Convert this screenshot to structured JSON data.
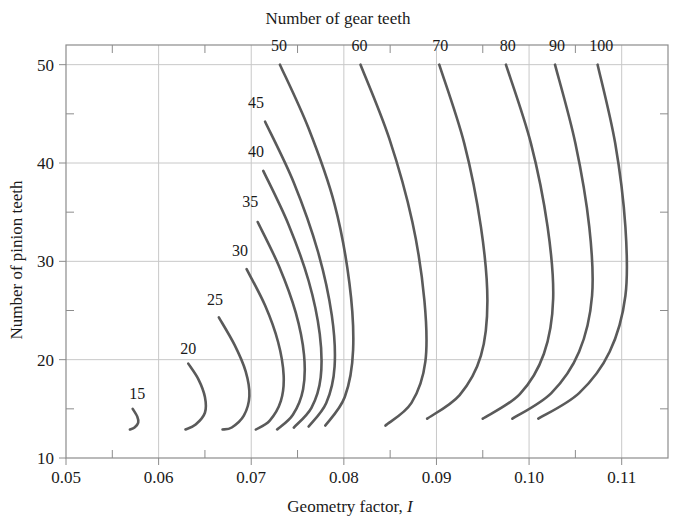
{
  "chart_data": {
    "type": "line",
    "title": "Number of gear teeth",
    "xlabel": "Geometry factor, I",
    "ylabel": "Number of pinion teeth",
    "xlim": [
      0.05,
      0.115
    ],
    "ylim": [
      10,
      52
    ],
    "xticks": [
      "0.05",
      "0.06",
      "0.07",
      "0.08",
      "0.09",
      "0.10",
      "0.11"
    ],
    "xtick_values": [
      0.05,
      0.06,
      0.07,
      0.08,
      0.09,
      0.1,
      0.11
    ],
    "yticks": [
      "10",
      "20",
      "30",
      "40",
      "50"
    ],
    "ytick_values": [
      10,
      20,
      30,
      40,
      50
    ],
    "yminor_values": [
      15,
      25,
      35,
      45
    ],
    "xminor_values": [
      0.055,
      0.065,
      0.075,
      0.085,
      0.095,
      0.105
    ],
    "grid": true,
    "legend_position": "inline-curve-labels",
    "line_color": "#5a5a5a",
    "grid_color": "#c8c8c8",
    "axis_color": "#8c8c8c",
    "series": [
      {
        "name": "15",
        "label": "15",
        "label_pos": {
          "x": 0.0577,
          "y": 16.0
        },
        "points": [
          {
            "x": 0.0572,
            "y": 15.0
          },
          {
            "x": 0.0577,
            "y": 14.2
          },
          {
            "x": 0.0578,
            "y": 13.6
          },
          {
            "x": 0.0574,
            "y": 13.1
          },
          {
            "x": 0.0569,
            "y": 12.9
          }
        ]
      },
      {
        "name": "20",
        "label": "20",
        "label_pos": {
          "x": 0.0632,
          "y": 20.6
        },
        "points": [
          {
            "x": 0.0632,
            "y": 19.6
          },
          {
            "x": 0.0643,
            "y": 18.0
          },
          {
            "x": 0.065,
            "y": 16.2
          },
          {
            "x": 0.065,
            "y": 14.6
          },
          {
            "x": 0.064,
            "y": 13.4
          },
          {
            "x": 0.0629,
            "y": 12.9
          }
        ]
      },
      {
        "name": "25",
        "label": "25",
        "label_pos": {
          "x": 0.0661,
          "y": 25.6
        },
        "points": [
          {
            "x": 0.0665,
            "y": 24.3
          },
          {
            "x": 0.0682,
            "y": 21.5
          },
          {
            "x": 0.0694,
            "y": 18.8
          },
          {
            "x": 0.0698,
            "y": 16.3
          },
          {
            "x": 0.0692,
            "y": 14.3
          },
          {
            "x": 0.0679,
            "y": 13.1
          },
          {
            "x": 0.0669,
            "y": 12.9
          }
        ]
      },
      {
        "name": "30",
        "label": "30",
        "label_pos": {
          "x": 0.0688,
          "y": 30.5
        },
        "points": [
          {
            "x": 0.0695,
            "y": 29.2
          },
          {
            "x": 0.0715,
            "y": 25.5
          },
          {
            "x": 0.0729,
            "y": 21.8
          },
          {
            "x": 0.0735,
            "y": 18.4
          },
          {
            "x": 0.0732,
            "y": 15.8
          },
          {
            "x": 0.072,
            "y": 13.8
          },
          {
            "x": 0.0705,
            "y": 12.9
          }
        ]
      },
      {
        "name": "35",
        "label": "35",
        "label_pos": {
          "x": 0.0699,
          "y": 35.5
        },
        "points": [
          {
            "x": 0.0707,
            "y": 34.0
          },
          {
            "x": 0.073,
            "y": 29.5
          },
          {
            "x": 0.0748,
            "y": 24.8
          },
          {
            "x": 0.0757,
            "y": 20.5
          },
          {
            "x": 0.0756,
            "y": 17.0
          },
          {
            "x": 0.0745,
            "y": 14.4
          },
          {
            "x": 0.0728,
            "y": 12.9
          }
        ]
      },
      {
        "name": "40",
        "label": "40",
        "label_pos": {
          "x": 0.0705,
          "y": 40.6
        },
        "points": [
          {
            "x": 0.0713,
            "y": 39.2
          },
          {
            "x": 0.074,
            "y": 33.8
          },
          {
            "x": 0.0762,
            "y": 28.0
          },
          {
            "x": 0.0774,
            "y": 22.6
          },
          {
            "x": 0.0775,
            "y": 18.2
          },
          {
            "x": 0.0765,
            "y": 15.1
          },
          {
            "x": 0.0746,
            "y": 13.1
          }
        ]
      },
      {
        "name": "45",
        "label": "45",
        "label_pos": {
          "x": 0.0705,
          "y": 45.6
        },
        "points": [
          {
            "x": 0.0715,
            "y": 44.2
          },
          {
            "x": 0.0746,
            "y": 38.0
          },
          {
            "x": 0.0772,
            "y": 31.0
          },
          {
            "x": 0.0787,
            "y": 24.5
          },
          {
            "x": 0.079,
            "y": 19.3
          },
          {
            "x": 0.0781,
            "y": 15.6
          },
          {
            "x": 0.0762,
            "y": 13.2
          }
        ]
      },
      {
        "name": "50",
        "label": "50",
        "label_pos": {
          "x": 0.073,
          "y": 51.4
        },
        "points": [
          {
            "x": 0.0731,
            "y": 50.0
          },
          {
            "x": 0.0762,
            "y": 43.5
          },
          {
            "x": 0.079,
            "y": 35.8
          },
          {
            "x": 0.0806,
            "y": 27.8
          },
          {
            "x": 0.081,
            "y": 21.0
          },
          {
            "x": 0.0801,
            "y": 16.2
          },
          {
            "x": 0.078,
            "y": 13.3
          }
        ]
      },
      {
        "name": "60",
        "label": "60",
        "label_pos": {
          "x": 0.0817,
          "y": 51.4
        },
        "points": [
          {
            "x": 0.0818,
            "y": 50.0
          },
          {
            "x": 0.0849,
            "y": 42.5
          },
          {
            "x": 0.0874,
            "y": 34.0
          },
          {
            "x": 0.0887,
            "y": 26.0
          },
          {
            "x": 0.0888,
            "y": 19.8
          },
          {
            "x": 0.0873,
            "y": 15.6
          },
          {
            "x": 0.0845,
            "y": 13.3
          }
        ]
      },
      {
        "name": "70",
        "label": "70",
        "label_pos": {
          "x": 0.0904,
          "y": 51.4
        },
        "points": [
          {
            "x": 0.0903,
            "y": 50.0
          },
          {
            "x": 0.093,
            "y": 42.0
          },
          {
            "x": 0.0948,
            "y": 33.5
          },
          {
            "x": 0.0955,
            "y": 26.0
          },
          {
            "x": 0.0948,
            "y": 20.4
          },
          {
            "x": 0.0925,
            "y": 16.4
          },
          {
            "x": 0.089,
            "y": 14.0
          }
        ]
      },
      {
        "name": "80",
        "label": "80",
        "label_pos": {
          "x": 0.0977,
          "y": 51.4
        },
        "points": [
          {
            "x": 0.0975,
            "y": 50.0
          },
          {
            "x": 0.1002,
            "y": 42.0
          },
          {
            "x": 0.102,
            "y": 33.5
          },
          {
            "x": 0.1026,
            "y": 26.2
          },
          {
            "x": 0.1016,
            "y": 20.6
          },
          {
            "x": 0.099,
            "y": 16.5
          },
          {
            "x": 0.095,
            "y": 14.0
          }
        ]
      },
      {
        "name": "90",
        "label": "90",
        "label_pos": {
          "x": 0.103,
          "y": 51.4
        },
        "points": [
          {
            "x": 0.1028,
            "y": 50.0
          },
          {
            "x": 0.105,
            "y": 42.0
          },
          {
            "x": 0.1065,
            "y": 33.5
          },
          {
            "x": 0.1068,
            "y": 26.5
          },
          {
            "x": 0.1054,
            "y": 20.8
          },
          {
            "x": 0.1024,
            "y": 16.6
          },
          {
            "x": 0.0982,
            "y": 14.0
          }
        ]
      },
      {
        "name": "100",
        "label": "100",
        "label_pos": {
          "x": 0.1078,
          "y": 51.4
        },
        "points": [
          {
            "x": 0.1074,
            "y": 50.0
          },
          {
            "x": 0.1093,
            "y": 42.0
          },
          {
            "x": 0.1104,
            "y": 33.5
          },
          {
            "x": 0.1104,
            "y": 26.5
          },
          {
            "x": 0.1087,
            "y": 20.8
          },
          {
            "x": 0.1054,
            "y": 16.6
          },
          {
            "x": 0.101,
            "y": 14.0
          }
        ]
      }
    ]
  }
}
